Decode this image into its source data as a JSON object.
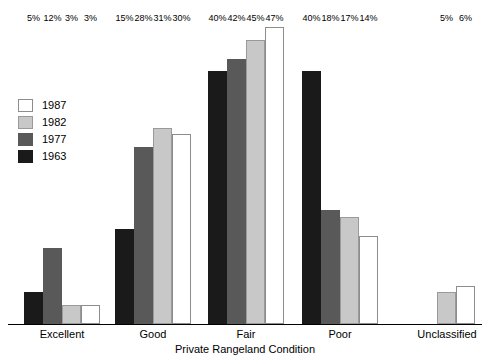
{
  "chart_data": {
    "type": "bar",
    "title": "",
    "xlabel": "Private Rangeland Condition",
    "ylabel": "",
    "ylim": [
      0,
      50
    ],
    "grid": false,
    "legend_position": "left-middle",
    "value_label_suffix": "%",
    "categories": [
      "Excellent",
      "Good",
      "Fair",
      "Poor",
      "Unclassified"
    ],
    "series": [
      {
        "name": "1963",
        "color": "#1a1a1a",
        "values": [
          5,
          15,
          40,
          40,
          null
        ],
        "labels": [
          "5%",
          "15%",
          "40%",
          "40%",
          ""
        ]
      },
      {
        "name": "1977",
        "color": "#595959",
        "values": [
          12,
          28,
          42,
          18,
          null
        ],
        "labels": [
          "12%",
          "28%",
          "42%",
          "18%",
          ""
        ]
      },
      {
        "name": "1982",
        "color": "#c8c8c8",
        "values": [
          3,
          31,
          45,
          17,
          5
        ],
        "labels": [
          "3%",
          "31%",
          "45%",
          "17%",
          "5%"
        ]
      },
      {
        "name": "1987",
        "color": "#ffffff",
        "values": [
          3,
          30,
          47,
          14,
          6
        ],
        "labels": [
          "3%",
          "30%",
          "47%",
          "14%",
          "6%"
        ]
      }
    ],
    "legend_order": [
      "1987",
      "1982",
      "1977",
      "1963"
    ]
  },
  "legend": {
    "items": [
      {
        "label": "1987",
        "swatch": "white-swatch"
      },
      {
        "label": "1982",
        "swatch": "light-gray-swatch"
      },
      {
        "label": "1977",
        "swatch": "dark-gray-swatch"
      },
      {
        "label": "1963",
        "swatch": "black-swatch"
      }
    ]
  },
  "axis": {
    "title": "Private Rangeland Condition"
  },
  "groups": [
    {
      "name": "Excellent",
      "bars": [
        {
          "year": "1963",
          "label": "5%",
          "value": 5
        },
        {
          "year": "1977",
          "label": "12%",
          "value": 12
        },
        {
          "year": "1982",
          "label": "3%",
          "value": 3
        },
        {
          "year": "1987",
          "label": "3%",
          "value": 3
        }
      ]
    },
    {
      "name": "Good",
      "bars": [
        {
          "year": "1963",
          "label": "15%",
          "value": 15
        },
        {
          "year": "1977",
          "label": "28%",
          "value": 28
        },
        {
          "year": "1982",
          "label": "31%",
          "value": 31
        },
        {
          "year": "1987",
          "label": "30%",
          "value": 30
        }
      ]
    },
    {
      "name": "Fair",
      "bars": [
        {
          "year": "1963",
          "label": "40%",
          "value": 40
        },
        {
          "year": "1977",
          "label": "42%",
          "value": 42
        },
        {
          "year": "1982",
          "label": "45%",
          "value": 45
        },
        {
          "year": "1987",
          "label": "47%",
          "value": 47
        }
      ]
    },
    {
      "name": "Poor",
      "bars": [
        {
          "year": "1963",
          "label": "40%",
          "value": 40
        },
        {
          "year": "1977",
          "label": "18%",
          "value": 18
        },
        {
          "year": "1982",
          "label": "17%",
          "value": 17
        },
        {
          "year": "1987",
          "label": "14%",
          "value": 14
        }
      ]
    },
    {
      "name": "Unclassified",
      "bars": [
        {
          "year": "1982",
          "label": "5%",
          "value": 5
        },
        {
          "year": "1987",
          "label": "6%",
          "value": 6
        }
      ]
    }
  ],
  "scale": {
    "px_per_percent": 6.32
  }
}
